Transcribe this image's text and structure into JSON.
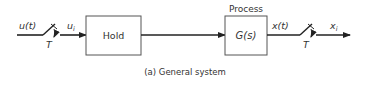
{
  "diagram": {
    "caption": "(a) General system",
    "input_signal": "u(t)",
    "sampled_input": "u",
    "sampled_input_sub": "i",
    "input_sampler_period": "T",
    "hold_block": "Hold",
    "process_title": "Process",
    "process_block": "G(s)",
    "output_signal": "x(t)",
    "output_sampler_period": "T",
    "sampled_output": "x",
    "sampled_output_sub": "i"
  },
  "colors": {
    "line": "#222222",
    "box_border": "#555555",
    "text": "#333333"
  }
}
